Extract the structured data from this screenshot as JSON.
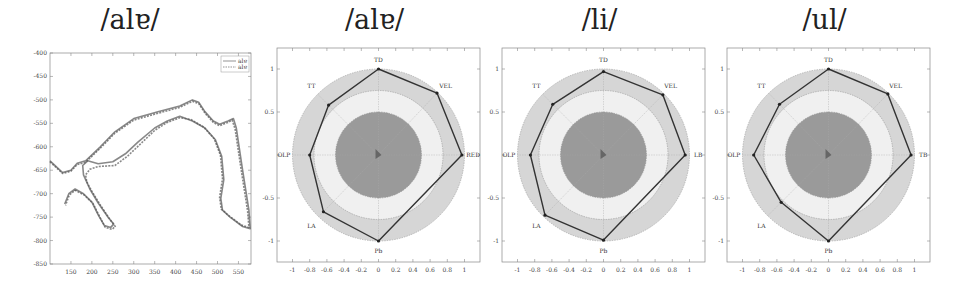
{
  "chart_data": [
    {
      "type": "line",
      "title": "/alɐ/",
      "xlabel": "",
      "ylabel": "",
      "xlim": [
        100,
        580
      ],
      "ylim": [
        -850,
        -400
      ],
      "x_ticks": [
        150,
        200,
        250,
        300,
        350,
        400,
        450,
        500,
        550
      ],
      "y_ticks": [
        -400,
        -450,
        -500,
        -550,
        -600,
        -650,
        -700,
        -750,
        -800,
        -850
      ],
      "grid": false,
      "legend": {
        "position": "upper right",
        "entries": [
          "alɐ",
          "alɐ"
        ]
      },
      "series": [
        {
          "name": "alɐ",
          "style": "solid",
          "points": [
            [
              100,
              -630
            ],
            [
              130,
              -655
            ],
            [
              150,
              -650
            ],
            [
              165,
              -635
            ],
            [
              185,
              -630
            ],
            [
              220,
              -600
            ],
            [
              255,
              -568
            ],
            [
              300,
              -540
            ],
            [
              360,
              -525
            ],
            [
              410,
              -513
            ],
            [
              440,
              -500
            ],
            [
              455,
              -505
            ],
            [
              470,
              -525
            ],
            [
              490,
              -545
            ],
            [
              505,
              -552
            ],
            [
              525,
              -545
            ],
            [
              538,
              -540
            ],
            [
              545,
              -560
            ],
            [
              560,
              -650
            ],
            [
              575,
              -735
            ],
            [
              578,
              -775
            ],
            [
              560,
              -770
            ],
            [
              530,
              -750
            ],
            [
              512,
              -735
            ],
            [
              508,
              -710
            ],
            [
              515,
              -670
            ],
            [
              510,
              -620
            ],
            [
              495,
              -585
            ],
            [
              470,
              -560
            ],
            [
              440,
              -545
            ],
            [
              410,
              -535
            ],
            [
              380,
              -545
            ],
            [
              350,
              -560
            ],
            [
              310,
              -590
            ],
            [
              280,
              -615
            ],
            [
              250,
              -632
            ],
            [
              215,
              -636
            ],
            [
              190,
              -630
            ],
            [
              178,
              -640
            ],
            [
              180,
              -660
            ],
            [
              195,
              -690
            ],
            [
              215,
              -720
            ],
            [
              240,
              -752
            ],
            [
              252,
              -765
            ],
            [
              245,
              -772
            ],
            [
              230,
              -768
            ],
            [
              215,
              -745
            ],
            [
              200,
              -718
            ],
            [
              180,
              -700
            ],
            [
              160,
              -690
            ],
            [
              145,
              -700
            ],
            [
              135,
              -722
            ]
          ]
        },
        {
          "name": "alɐ",
          "style": "dashed",
          "points": [
            [
              100,
              -632
            ],
            [
              130,
              -657
            ],
            [
              150,
              -652
            ],
            [
              165,
              -638
            ],
            [
              185,
              -633
            ],
            [
              220,
              -603
            ],
            [
              255,
              -571
            ],
            [
              300,
              -543
            ],
            [
              360,
              -528
            ],
            [
              410,
              -516
            ],
            [
              440,
              -503
            ],
            [
              455,
              -508
            ],
            [
              470,
              -528
            ],
            [
              490,
              -548
            ],
            [
              505,
              -555
            ],
            [
              525,
              -548
            ],
            [
              535,
              -543
            ],
            [
              542,
              -562
            ],
            [
              557,
              -652
            ],
            [
              572,
              -737
            ],
            [
              575,
              -772
            ],
            [
              557,
              -767
            ],
            [
              527,
              -747
            ],
            [
              509,
              -733
            ],
            [
              505,
              -708
            ],
            [
              512,
              -668
            ],
            [
              507,
              -618
            ],
            [
              492,
              -583
            ],
            [
              467,
              -558
            ],
            [
              437,
              -542
            ],
            [
              410,
              -538
            ],
            [
              380,
              -548
            ],
            [
              350,
              -565
            ],
            [
              315,
              -595
            ],
            [
              285,
              -620
            ],
            [
              255,
              -640
            ],
            [
              215,
              -642
            ],
            [
              195,
              -648
            ],
            [
              185,
              -660
            ],
            [
              188,
              -675
            ],
            [
              200,
              -695
            ],
            [
              220,
              -724
            ],
            [
              244,
              -756
            ],
            [
              256,
              -770
            ],
            [
              248,
              -776
            ],
            [
              232,
              -772
            ],
            [
              218,
              -748
            ],
            [
              203,
              -721
            ],
            [
              182,
              -703
            ],
            [
              160,
              -693
            ],
            [
              146,
              -703
            ],
            [
              137,
              -725
            ]
          ]
        }
      ]
    },
    {
      "type": "radar",
      "title": "/alɐ/",
      "xlim": [
        -1.2,
        1.2
      ],
      "ylim": [
        -1.2,
        1.2
      ],
      "x_ticks": [
        -1,
        -0.8,
        -0.6,
        -0.4,
        -0.2,
        0,
        0.2,
        0.4,
        0.6,
        0.8,
        1
      ],
      "y_ticks": [
        1,
        0.5,
        0,
        -0.5,
        -1
      ],
      "rings": [
        0.5,
        0.75,
        1.0
      ],
      "axes_labels": [
        "TD",
        "VEL",
        "RED",
        "Pb",
        "LA",
        "OLP",
        "TT"
      ],
      "vertices": [
        [
          0,
          1.0
        ],
        [
          0.68,
          0.72
        ],
        [
          0.97,
          0
        ],
        [
          0,
          -1.0
        ],
        [
          -0.64,
          -0.66
        ],
        [
          -0.8,
          0
        ],
        [
          -0.58,
          0.58
        ]
      ]
    },
    {
      "type": "radar",
      "title": "/li/",
      "xlim": [
        -1.2,
        1.2
      ],
      "ylim": [
        -1.2,
        1.2
      ],
      "x_ticks": [
        -1,
        -0.8,
        -0.6,
        -0.4,
        -0.2,
        0,
        0.2,
        0.4,
        0.6,
        0.8,
        1
      ],
      "y_ticks": [
        1,
        0.5,
        0,
        -0.5,
        -1
      ],
      "rings": [
        0.5,
        0.75,
        1.0
      ],
      "axes_labels": [
        "TD",
        "VEL",
        "LB",
        "Pb",
        "LA",
        "OLP",
        "TT"
      ],
      "vertices": [
        [
          0,
          0.97
        ],
        [
          0.69,
          0.7
        ],
        [
          0.95,
          0
        ],
        [
          0,
          -0.99
        ],
        [
          -0.68,
          -0.7
        ],
        [
          -0.85,
          0
        ],
        [
          -0.59,
          0.59
        ]
      ]
    },
    {
      "type": "radar",
      "title": "/ul/",
      "xlim": [
        -1.2,
        1.2
      ],
      "ylim": [
        -1.2,
        1.2
      ],
      "x_ticks": [
        -1,
        -0.8,
        -0.6,
        -0.4,
        -0.2,
        0,
        0.2,
        0.4,
        0.6,
        0.8,
        1
      ],
      "y_ticks": [
        1,
        0.5,
        0,
        -0.5,
        -1
      ],
      "rings": [
        0.5,
        0.75,
        1.0
      ],
      "axes_labels": [
        "TD",
        "VEL",
        "TB",
        "Pb",
        "LA",
        "OLP",
        "TT"
      ],
      "vertices": [
        [
          0,
          1.0
        ],
        [
          0.69,
          0.71
        ],
        [
          0.96,
          0
        ],
        [
          0,
          -1.0
        ],
        [
          -0.55,
          -0.55
        ],
        [
          -0.87,
          0
        ],
        [
          -0.57,
          0.59
        ]
      ]
    }
  ],
  "panels": {
    "p1": {
      "title": "/alɐ/",
      "legend": [
        "alɐ",
        "alɐ"
      ]
    },
    "p2": {
      "title": "/alɐ/"
    },
    "p3": {
      "title": "/li/"
    },
    "p4": {
      "title": "/ul/"
    }
  },
  "colors": {
    "line": "#555555",
    "polygon": "#333333",
    "inner_disk": "#9a9a9a",
    "middle_ring": "#f0f0f0",
    "outer_ring": "#d6d6d6"
  }
}
